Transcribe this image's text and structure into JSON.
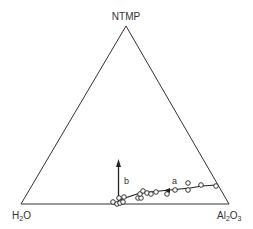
{
  "diagram": {
    "type": "ternary",
    "vertices": {
      "top": "NTMP",
      "bottom_left": "H2O",
      "bottom_right": "Al2O3"
    },
    "vertex_labels": {
      "top": {
        "main": "NTMP"
      },
      "bottom_left": {
        "main": "H",
        "sub": "2",
        "rest": "O"
      },
      "bottom_right": {
        "main": "Al",
        "sub": "2",
        "rest": "O",
        "sub2": "3"
      }
    },
    "curves": [
      {
        "label": "a",
        "description": "trend line through data points along the base toward Al2O3"
      },
      {
        "label": "b",
        "description": "vertical arrow pointing toward NTMP"
      }
    ],
    "line_color": "#222222",
    "background": "#ffffff"
  }
}
